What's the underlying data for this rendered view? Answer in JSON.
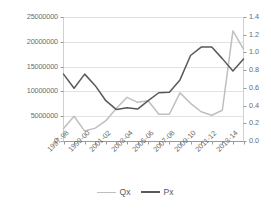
{
  "chart_data": {
    "type": "line",
    "title": "",
    "xlabel": "",
    "ylabel": "",
    "grid": true,
    "legend_position": "bottom",
    "categories": [
      "1997-98",
      "1998-99",
      "1999-00",
      "2000-01",
      "2001-02",
      "2002-03",
      "2003-04",
      "2004-05",
      "2005-06",
      "2006-07",
      "2007-08",
      "2008-09",
      "2009-10",
      "2010-11",
      "2011-12",
      "2012-13",
      "2013-14",
      "2014-15"
    ],
    "xtick_labels": [
      "1997-98",
      "1999-00",
      "2001-02",
      "2003-04",
      "2005-06",
      "2007-08",
      "2009-10",
      "2011-12",
      "2013-14"
    ],
    "left_axis": {
      "ticks": [
        "0",
        "5000000",
        "10000000",
        "15000000",
        "20000000",
        "25000000"
      ],
      "ylim": [
        0,
        25000000
      ],
      "step": 5000000
    },
    "right_axis": {
      "ticks": [
        "0",
        "0",
        "0",
        "0",
        "0",
        "1",
        "1",
        "1"
      ],
      "ticks_full": [
        "0.0",
        "0.2",
        "0.4",
        "0.6",
        "0.8",
        "1.0",
        "1.2",
        "1.4"
      ],
      "ylim": [
        0,
        1.4
      ],
      "step": 0.2,
      "note": "labels truncated at image edge, only leading digit visible"
    },
    "series": [
      {
        "name": "Qx",
        "axis": "left",
        "color": "#bfbfbf",
        "values": [
          2500000,
          5000000,
          2000000,
          2600000,
          4100000,
          6600000,
          8800000,
          7800000,
          8100000,
          5400000,
          5400000,
          9700000,
          7600000,
          5900000,
          5200000,
          6200000,
          22200000,
          18500000
        ]
      },
      {
        "name": "Px",
        "axis": "right",
        "color": "#595959",
        "values": [
          0.755,
          0.595,
          0.755,
          0.625,
          0.455,
          0.355,
          0.375,
          0.36,
          0.455,
          0.545,
          0.55,
          0.69,
          0.965,
          1.06,
          1.06,
          0.93,
          0.79,
          0.925
        ],
        "values_left_scale_equivalent": [
          13500000,
          10650000,
          13500000,
          11150000,
          8150000,
          6350000,
          6700000,
          6450000,
          8150000,
          9750000,
          9850000,
          12350000,
          17250000,
          21150000,
          21100000,
          16600000,
          14100000,
          16500000
        ]
      }
    ],
    "legend": [
      {
        "label": "Qx",
        "color": "#bfbfbf"
      },
      {
        "label": "Px",
        "color": "#595959"
      }
    ]
  }
}
